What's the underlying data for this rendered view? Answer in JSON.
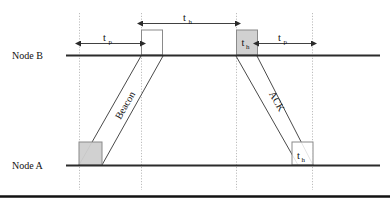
{
  "figure": {
    "title": "",
    "type": "timing-diagram",
    "background_color": "#ffffff",
    "line_color": "#2b2b2b",
    "dashed_color": "#b9b9b9",
    "box_fill": "#cfcfcf",
    "box_stroke": "#8a8a8a",
    "white_box_fill": "#ffffff"
  },
  "axes": {
    "node_b": {
      "label": "Node B",
      "label_main": "Node",
      "label_id": "B"
    },
    "node_a": {
      "label": "Node A",
      "label_main": "Node",
      "label_id": "A"
    }
  },
  "measurements": [
    {
      "id": "tp-left",
      "base": "t",
      "sub": "p",
      "label": "tp"
    },
    {
      "id": "th-top",
      "base": "t",
      "sub": "h",
      "label": "th"
    },
    {
      "id": "tp-right",
      "base": "t",
      "sub": "p",
      "label": "tp"
    }
  ],
  "boxes": [
    {
      "id": "node-a-tx-box",
      "base": "",
      "sub": "",
      "fill": "gray"
    },
    {
      "id": "node-b-rx-box",
      "base": "",
      "sub": "",
      "fill": "white"
    },
    {
      "id": "node-b-th-box",
      "base": "t",
      "sub": "h",
      "fill": "gray"
    },
    {
      "id": "node-a-th-box",
      "base": "t",
      "sub": "h",
      "fill": "white"
    }
  ],
  "messages": [
    {
      "id": "beacon-message",
      "label": "Beacon",
      "direction": "B-to-A"
    },
    {
      "id": "ack-message",
      "label": "ACK",
      "direction": "B-to-A"
    }
  ],
  "timeline_markers": [
    {
      "id": "marker-1",
      "x": 79
    },
    {
      "id": "marker-2",
      "x": 141
    },
    {
      "id": "marker-3",
      "x": 236
    },
    {
      "id": "marker-4",
      "x": 312
    }
  ]
}
